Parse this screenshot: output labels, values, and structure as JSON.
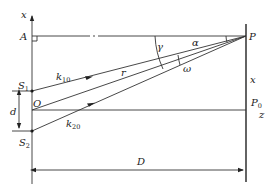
{
  "diagram": {
    "type": "double-slit interference geometry",
    "labels": {
      "x_axis_top": "x",
      "point_A": "A",
      "point_P": "P",
      "source_S1": "S",
      "source_S1_sub": "1",
      "origin_O": "O",
      "source_S2": "S",
      "source_S2_sub": "2",
      "slit_separation": "d",
      "screen_distance": "D",
      "screen_coordinate": "x",
      "point_P0": "P",
      "point_P0_sub": "0",
      "z_axis": "z",
      "wave_vector_1": "k",
      "wave_vector_1_sub": "10",
      "wave_vector_2": "k",
      "wave_vector_2_sub": "20",
      "radius": "r",
      "angle_alpha": "α",
      "angle_gamma": "γ",
      "angle_omega": "ω"
    },
    "colors": {
      "line": "#333333",
      "text": "#222222",
      "background": "#ffffff"
    }
  }
}
